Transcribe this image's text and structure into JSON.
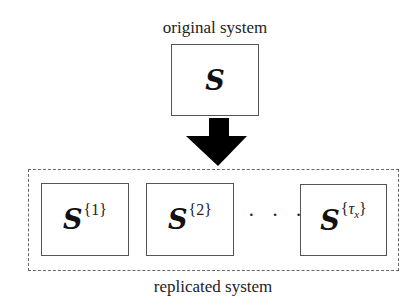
{
  "diagram": {
    "top_label": "original system",
    "original": {
      "symbol": "S"
    },
    "arrow": {
      "direction": "down",
      "color": "#000000"
    },
    "replicas": [
      {
        "symbol": "S",
        "superscript_open": "{",
        "index": "1",
        "superscript_close": "}"
      },
      {
        "symbol": "S",
        "superscript_open": "{",
        "index": "2",
        "superscript_close": "}"
      },
      {
        "symbol": "S",
        "superscript_open": "{",
        "index": "τ",
        "subscript": "x",
        "superscript_close": "}"
      }
    ],
    "ellipsis": "· · ·",
    "bottom_label": "replicated system"
  }
}
